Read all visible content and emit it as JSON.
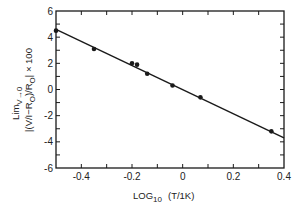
{
  "chart_data": {
    "type": "scatter",
    "title": "",
    "xlabel": "LOG10 (T/1K)",
    "xlabel_parts": {
      "main": "LOG",
      "sub": "10",
      "rest": "(T/1K)"
    },
    "ylabel": "Lim V→0 |(V/I−R0)/R0| × 100",
    "ylabel_parts": {
      "line1_main": "Lim",
      "line1_sub": "V→0",
      "line2_main": "|(V/I−R",
      "line2_sub1": "O",
      "line2_mid": ")/R",
      "line2_sub2": "O",
      "line2_end": "|  × 100"
    },
    "xlim": [
      -0.5,
      0.4
    ],
    "ylim": [
      -6,
      6
    ],
    "x_ticks": [
      -0.4,
      -0.3,
      -0.2,
      -0.1,
      0,
      0.1,
      0.2,
      0.3
    ],
    "x_tick_labels": [
      {
        "value": -0.4,
        "label": "-0.4"
      },
      {
        "value": -0.2,
        "label": "-0.2"
      },
      {
        "value": 0,
        "label": "0"
      },
      {
        "value": 0.2,
        "label": "0.2"
      },
      {
        "value": 0.4,
        "label": "0.4"
      }
    ],
    "y_ticks": [
      -5,
      -4,
      -3,
      -2,
      -1,
      0,
      1,
      2,
      3,
      4,
      5
    ],
    "y_tick_labels": [
      {
        "value": 6,
        "label": "6"
      },
      {
        "value": 4,
        "label": "4"
      },
      {
        "value": 2,
        "label": "2"
      },
      {
        "value": 0,
        "label": "0"
      },
      {
        "value": -2,
        "label": "-2"
      },
      {
        "value": -4,
        "label": "-4"
      },
      {
        "value": -6,
        "label": "-6"
      }
    ],
    "grid": false,
    "legend": null,
    "series": [
      {
        "name": "data",
        "type": "scatter",
        "points": [
          {
            "x": -0.5,
            "y": 4.5
          },
          {
            "x": -0.35,
            "y": 3.1
          },
          {
            "x": -0.2,
            "y": 2.0
          },
          {
            "x": -0.18,
            "y": 1.9
          },
          {
            "x": -0.14,
            "y": 1.2
          },
          {
            "x": -0.04,
            "y": 0.3
          },
          {
            "x": 0.07,
            "y": -0.6
          },
          {
            "x": 0.35,
            "y": -3.2
          }
        ]
      },
      {
        "name": "linear fit",
        "type": "line",
        "points": [
          {
            "x": -0.5,
            "y": 4.6
          },
          {
            "x": 0.4,
            "y": -3.7
          }
        ]
      }
    ],
    "colors": {
      "axis": "#1a1a1a",
      "line": "#1a1a1a",
      "marker": "#1a1a1a"
    }
  }
}
